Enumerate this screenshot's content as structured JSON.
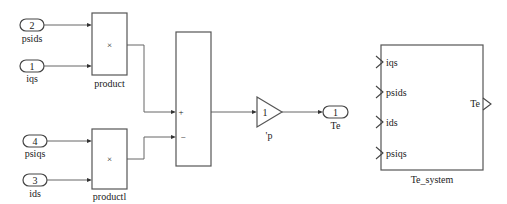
{
  "diagram": {
    "inports": [
      {
        "number": "2",
        "name": "psids"
      },
      {
        "number": "1",
        "name": "iqs"
      },
      {
        "number": "4",
        "name": "psiqs"
      },
      {
        "number": "3",
        "name": "ids"
      }
    ],
    "product_blocks": [
      {
        "name": "product",
        "symbol": "×"
      },
      {
        "name": "productl",
        "symbol": "×"
      }
    ],
    "sum_block": {
      "signs": [
        "+",
        "−"
      ]
    },
    "gain_block": {
      "value": "1",
      "annotation": "'p"
    },
    "outport": {
      "number": "1",
      "name": "Te"
    },
    "subsystem": {
      "name": "Te_system",
      "inputs": [
        "iqs",
        "psids",
        "ids",
        "psiqs"
      ],
      "outputs": [
        "Te"
      ]
    }
  }
}
